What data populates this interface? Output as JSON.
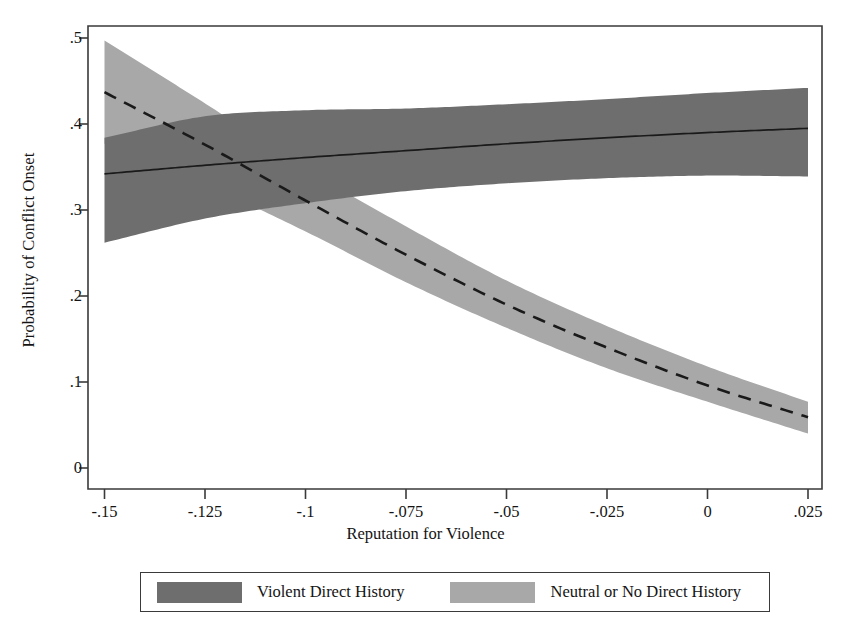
{
  "chart_data": {
    "type": "line",
    "title": "",
    "xlabel": "Reputation for Violence",
    "ylabel": "Probability of Conflict Onset",
    "xlim": [
      -0.15,
      0.025
    ],
    "ylim": [
      0,
      0.5
    ],
    "xticks": [
      "-.15",
      "-.125",
      "-.1",
      "-.075",
      "-.05",
      "-.025",
      "0",
      ".025"
    ],
    "xtick_values": [
      -0.15,
      -0.125,
      -0.1,
      -0.075,
      -0.05,
      -0.025,
      0,
      0.025
    ],
    "yticks": [
      "0",
      ".1",
      ".2",
      ".3",
      ".4",
      ".5"
    ],
    "ytick_values": [
      0,
      0.1,
      0.2,
      0.3,
      0.4,
      0.5
    ],
    "grid": false,
    "legend_position": "bottom",
    "x": [
      -0.15,
      -0.125,
      -0.1,
      -0.075,
      -0.05,
      -0.025,
      0,
      0.025
    ],
    "series": [
      {
        "name": "Violent Direct History",
        "style": "solid",
        "color": "#6e6e6e",
        "line_color": "#1a1a1a",
        "values": [
          0.342,
          0.352,
          0.361,
          0.369,
          0.377,
          0.384,
          0.39,
          0.395
        ],
        "ci_lower": [
          0.262,
          0.29,
          0.308,
          0.322,
          0.331,
          0.337,
          0.34,
          0.339
        ],
        "ci_upper": [
          0.384,
          0.409,
          0.416,
          0.418,
          0.423,
          0.429,
          0.436,
          0.442
        ]
      },
      {
        "name": "Neutral or No Direct History",
        "style": "dashed",
        "color": "#a8a8a8",
        "line_color": "#1a1a1a",
        "values": [
          0.437,
          0.376,
          0.311,
          0.248,
          0.19,
          0.14,
          0.096,
          0.059
        ],
        "ci_lower": [
          0.377,
          0.33,
          0.275,
          0.216,
          0.163,
          0.116,
          0.077,
          0.04
        ],
        "ci_upper": [
          0.497,
          0.424,
          0.348,
          0.281,
          0.218,
          0.165,
          0.118,
          0.077
        ]
      }
    ]
  },
  "legend": {
    "entries": [
      {
        "label": "Violent Direct History",
        "color": "#6e6e6e"
      },
      {
        "label": "Neutral or No Direct History",
        "color": "#a8a8a8"
      }
    ]
  }
}
